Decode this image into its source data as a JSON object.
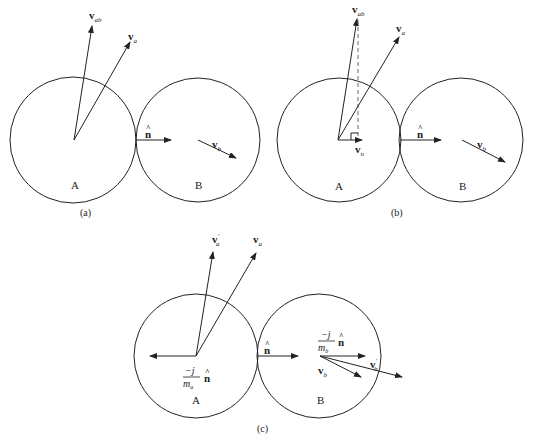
{
  "panels": [
    {
      "id": "a",
      "caption": "(a)",
      "bodies": [
        {
          "label": "A"
        },
        {
          "label": "B"
        }
      ],
      "vectors": [
        {
          "base": "v",
          "sub": "ab",
          "prime": ""
        },
        {
          "base": "v",
          "sub": "a",
          "prime": ""
        },
        {
          "base": "n",
          "sub": "",
          "hat": true
        },
        {
          "base": "v",
          "sub": "b",
          "prime": ""
        }
      ]
    },
    {
      "id": "b",
      "caption": "(b)",
      "bodies": [
        {
          "label": "A"
        },
        {
          "label": "B"
        }
      ],
      "vectors": [
        {
          "base": "v",
          "sub": "ab",
          "prime": ""
        },
        {
          "base": "v",
          "sub": "a",
          "prime": ""
        },
        {
          "base": "v",
          "sub": "n",
          "prime": ""
        },
        {
          "base": "n",
          "sub": "",
          "hat": true
        },
        {
          "base": "v",
          "sub": "b",
          "prime": ""
        }
      ]
    },
    {
      "id": "c",
      "caption": "(c)",
      "bodies": [
        {
          "label": "A"
        },
        {
          "label": "B"
        }
      ],
      "vectors": [
        {
          "base": "v",
          "sub": "a",
          "prime": "′"
        },
        {
          "base": "v",
          "sub": "a",
          "prime": ""
        },
        {
          "base": "n",
          "sub": "",
          "hat": true
        },
        {
          "base": "v",
          "sub": "b",
          "prime": ""
        },
        {
          "base": "v",
          "sub": "b",
          "prime": "′"
        }
      ],
      "impulses": [
        {
          "numerator": "−j",
          "denominator_base": "m",
          "denominator_sub": "a",
          "unit": "n"
        },
        {
          "numerator": "−j",
          "denominator_base": "m",
          "denominator_sub": "b",
          "unit": "n"
        }
      ]
    }
  ],
  "hat_glyph": "^",
  "colors": {
    "stroke": "#222222",
    "background": "#ffffff",
    "dashed": "#666666"
  }
}
